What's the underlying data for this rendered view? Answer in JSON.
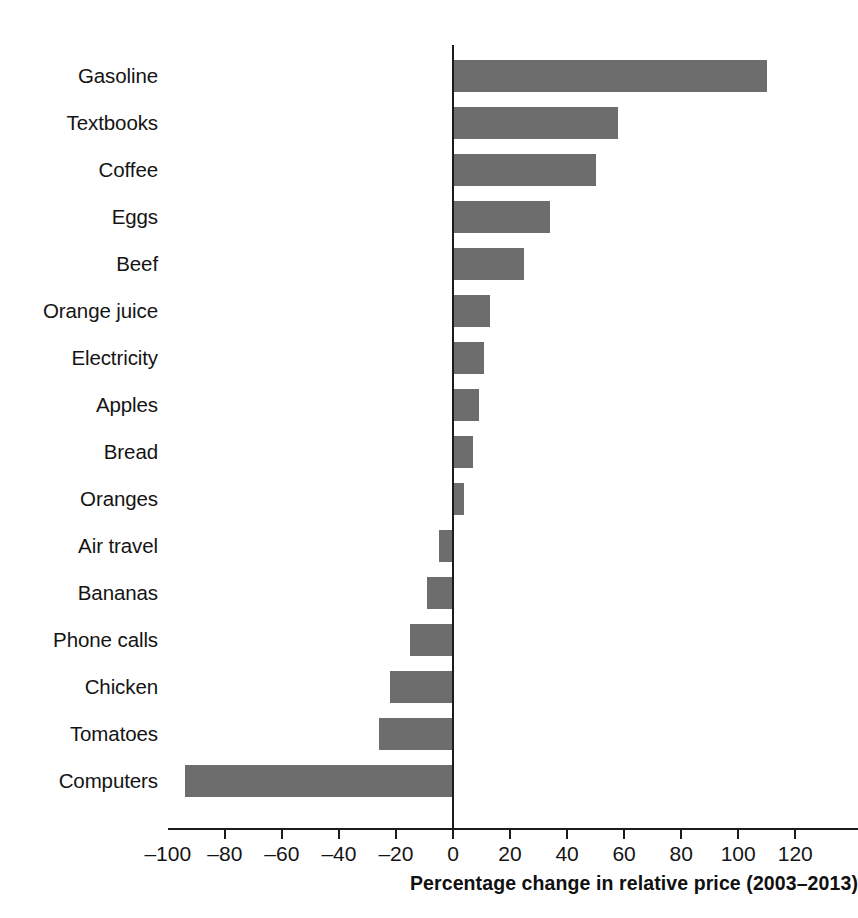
{
  "chart_data": {
    "type": "bar",
    "orientation": "horizontal",
    "title": "",
    "xlabel": "Percentage change in relative price (2003–2013)",
    "ylabel": "",
    "xlim": [
      -100,
      120
    ],
    "xticks": [
      -100,
      -80,
      -60,
      -40,
      -20,
      0,
      20,
      40,
      60,
      80,
      100,
      120
    ],
    "xticklabels": [
      "–100",
      "–80",
      "–60",
      "–40",
      "–20",
      "0",
      "20",
      "40",
      "60",
      "80",
      "100",
      "120"
    ],
    "grid": false,
    "legend": false,
    "bar_color": "#6d6d6d",
    "axis_color": "#1b1b1b",
    "categories": [
      "Gasoline",
      "Textbooks",
      "Coffee",
      "Eggs",
      "Beef",
      "Orange juice",
      "Electricity",
      "Apples",
      "Bread",
      "Oranges",
      "Air travel",
      "Bananas",
      "Phone calls",
      "Chicken",
      "Tomatoes",
      "Computers"
    ],
    "values": [
      110,
      58,
      50,
      34,
      25,
      13,
      11,
      9,
      7,
      4,
      -5,
      -9,
      -15,
      -22,
      -26,
      -94
    ]
  }
}
